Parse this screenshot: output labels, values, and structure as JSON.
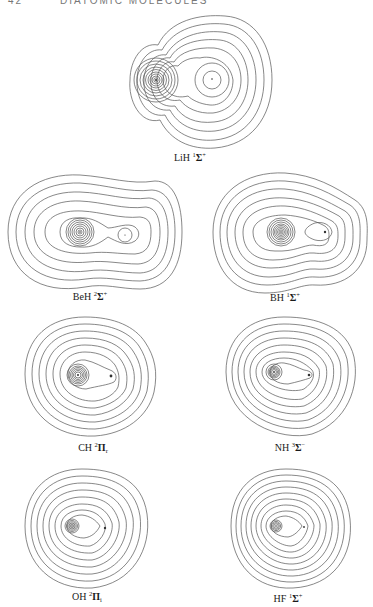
{
  "header": {
    "page_number": "42",
    "running_title": "DIATOMIC MOLECULES"
  },
  "figures": [
    {
      "id": "lih",
      "molecule": "LiH",
      "multiplicity": "1",
      "term": "Σ",
      "sup_suffix": "+",
      "sub": ""
    },
    {
      "id": "beh",
      "molecule": "BeH",
      "multiplicity": "2",
      "term": "Σ",
      "sup_suffix": "+",
      "sub": ""
    },
    {
      "id": "bh",
      "molecule": "BH",
      "multiplicity": "1",
      "term": "Σ",
      "sup_suffix": "+",
      "sub": ""
    },
    {
      "id": "ch",
      "molecule": "CH",
      "multiplicity": "2",
      "term": "Π",
      "sup_suffix": "",
      "sub": "r"
    },
    {
      "id": "nh",
      "molecule": "NH",
      "multiplicity": "3",
      "term": "Σ",
      "sup_suffix": "−",
      "sub": ""
    },
    {
      "id": "oh",
      "molecule": "OH",
      "multiplicity": "2",
      "term": "Π",
      "sup_suffix": "",
      "sub": "i"
    },
    {
      "id": "hf",
      "molecule": "HF",
      "multiplicity": "1",
      "term": "Σ",
      "sup_suffix": "+",
      "sub": ""
    }
  ],
  "figure_type": "electron density contour maps"
}
